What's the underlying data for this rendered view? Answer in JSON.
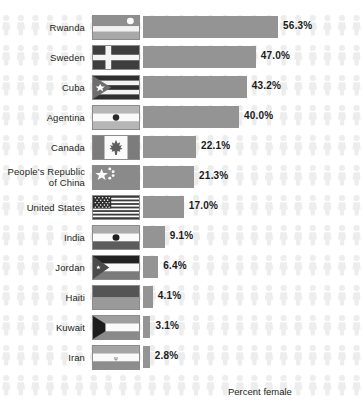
{
  "chart_data": {
    "type": "bar",
    "orientation": "horizontal",
    "title": "",
    "xlabel": "Percent female",
    "ylabel": "",
    "xlim": [
      0,
      60
    ],
    "grid": false,
    "legend": null,
    "value_suffix": "%",
    "categories": [
      "Rwanda",
      "Sweden",
      "Cuba",
      "Agentina",
      "Canada",
      "People's Republic of China",
      "United States",
      "India",
      "Jordan",
      "Haiti",
      "Kuwait",
      "Iran"
    ],
    "values": [
      56.3,
      47.0,
      43.2,
      40.0,
      22.1,
      21.3,
      17.0,
      9.1,
      6.4,
      4.1,
      3.1,
      2.8
    ],
    "value_labels": [
      "56.3%",
      "47.0%",
      "43.2%",
      "40.0%",
      "22.1%",
      "21.3%",
      "17.0%",
      "9.1%",
      "6.4%",
      "4.1%",
      "3.1%",
      "2.8%"
    ]
  },
  "rows": [
    {
      "label_line1": "Rwanda",
      "label_line2": "",
      "value_label": "56.3%",
      "value": 56.3,
      "flag": "flag-rwanda"
    },
    {
      "label_line1": "Sweden",
      "label_line2": "",
      "value_label": "47.0%",
      "value": 47.0,
      "flag": "flag-sweden"
    },
    {
      "label_line1": "Cuba",
      "label_line2": "",
      "value_label": "43.2%",
      "value": 43.2,
      "flag": "flag-cuba"
    },
    {
      "label_line1": "Agentina",
      "label_line2": "",
      "value_label": "40.0%",
      "value": 40.0,
      "flag": "flag-argentina"
    },
    {
      "label_line1": "Canada",
      "label_line2": "",
      "value_label": "22.1%",
      "value": 22.1,
      "flag": "flag-canada"
    },
    {
      "label_line1": "People's Republic",
      "label_line2": "of China",
      "value_label": "21.3%",
      "value": 21.3,
      "flag": "flag-china"
    },
    {
      "label_line1": "United States",
      "label_line2": "",
      "value_label": "17.0%",
      "value": 17.0,
      "flag": "flag-united-states"
    },
    {
      "label_line1": "India",
      "label_line2": "",
      "value_label": "9.1%",
      "value": 9.1,
      "flag": "flag-india"
    },
    {
      "label_line1": "Jordan",
      "label_line2": "",
      "value_label": "6.4%",
      "value": 6.4,
      "flag": "flag-jordan"
    },
    {
      "label_line1": "Haiti",
      "label_line2": "",
      "value_label": "4.1%",
      "value": 4.1,
      "flag": "flag-haiti"
    },
    {
      "label_line1": "Kuwait",
      "label_line2": "",
      "value_label": "3.1%",
      "value": 3.1,
      "flag": "flag-kuwait"
    },
    {
      "label_line1": "Iran",
      "label_line2": "",
      "value_label": "2.8%",
      "value": 2.8,
      "flag": "flag-iran"
    }
  ],
  "axis": {
    "caption": "Percent female"
  },
  "colors": {
    "bar": "#949494",
    "value_text": "#1a1a1a",
    "label_text": "#231f20",
    "background": "#ffffff",
    "person_icon": "#ededed",
    "flag_border": "#8c8c8c"
  },
  "layout": {
    "row_pitch": 30.0,
    "first_row_top": 12,
    "bar_origin_x": 153,
    "px_per_percent": 2.4,
    "value_gap": 5
  }
}
